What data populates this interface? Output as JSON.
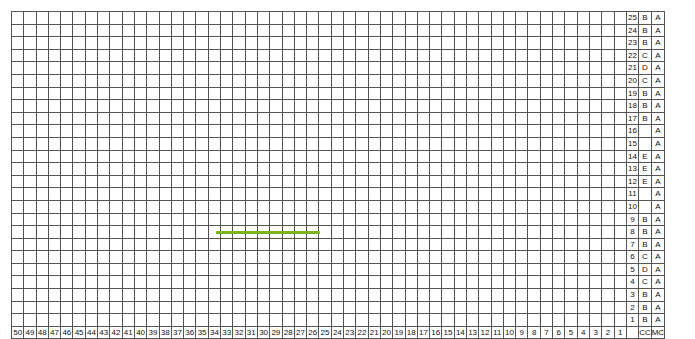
{
  "chart_meta": {
    "title": "Colorwork Knitting Chart",
    "columns": 50,
    "rows": 25,
    "column_direction": "right-to-left",
    "repeat_width": 12,
    "bottom_left_label": "",
    "legend_header_cc": "CC",
    "legend_header_mc": "MC"
  },
  "colors": {
    "A": "#ffffff",
    "B": "#d9576b",
    "C": "#d9a3b5",
    "D": "#f0931e",
    "E": "#9a4a12",
    "grid_line": "#555555",
    "marker": "#7ab51d",
    "background": "#ffffff",
    "text": "#111111"
  },
  "row_numbers": [
    25,
    24,
    23,
    22,
    21,
    20,
    19,
    18,
    17,
    16,
    15,
    14,
    13,
    12,
    11,
    10,
    9,
    8,
    7,
    6,
    5,
    4,
    3,
    2,
    1
  ],
  "column_numbers": [
    50,
    49,
    48,
    47,
    46,
    45,
    44,
    43,
    42,
    41,
    40,
    39,
    38,
    37,
    36,
    35,
    34,
    33,
    32,
    31,
    30,
    29,
    28,
    27,
    26,
    25,
    24,
    23,
    22,
    21,
    20,
    19,
    18,
    17,
    16,
    15,
    14,
    13,
    12,
    11,
    10,
    9,
    8,
    7,
    6,
    5,
    4,
    3,
    2,
    1
  ],
  "legend_cc": [
    "B",
    "B",
    "B",
    "C",
    "D",
    "C",
    "B",
    "B",
    "B",
    "",
    "",
    "E",
    "E",
    "E",
    "",
    "",
    "B",
    "B",
    "B",
    "C",
    "D",
    "C",
    "B",
    "B",
    "B"
  ],
  "legend_mc": [
    "A",
    "A",
    "A",
    "A",
    "A",
    "A",
    "A",
    "A",
    "A",
    "A",
    "A",
    "A",
    "A",
    "A",
    "A",
    "A",
    "A",
    "A",
    "A",
    "A",
    "A",
    "A",
    "A",
    "A",
    "A"
  ],
  "marker": {
    "name": "repeat-marker-line",
    "left_px": 216,
    "top_px": 231,
    "width_px": 104,
    "color": "#7ab51d",
    "spans_columns": "26-35"
  },
  "chart_data": {
    "type": "heatmap",
    "xlabel": "Stitch number",
    "ylabel": "Row number",
    "legend": [
      {
        "code": "A",
        "name": "MC white",
        "color": "#ffffff"
      },
      {
        "code": "B",
        "name": "dark pink",
        "color": "#d9576b"
      },
      {
        "code": "C",
        "name": "light pink",
        "color": "#d9a3b5"
      },
      {
        "code": "D",
        "name": "orange",
        "color": "#f0931e"
      },
      {
        "code": "E",
        "name": "brown",
        "color": "#9a4a12"
      }
    ],
    "grid": [
      "AAAAAABAAAAABAAAAABAAAAABAAAAABAAAAABAAAAABAAAAAB",
      "AAAAABBAAAABBAAAABBAAAABBAAAABBAAAABBAAAABBAAAABB",
      "BAABBAABBAABBAABBAABBAABBAABBAABBAABBAABBAABBAABB",
      "CAACCAACCAACCAACCAACCAACCAACCAACCAACCAACCAACCAACC",
      "AADAAAAADAAAAADAAAAADAAAAADAAAAADAAAAADAAAAADAAAA",
      "CAACCAACCAACCAACCAACCAACCAACCAACCAACCAACCAACCAACC",
      "BAABBAABBAABBAABBAABBAABBAABBAABBAABBAABBAABBAABB",
      "AAAAABBAAAABBAAAABBAAAABBAAAABBAAAABBAAAABBAAAABB",
      "AAAAAABAAAAABAAAAABAAAAABAAAAABAAAAABAAAAABAAAAAB",
      "AAAAAAAAAAAAAAAAAAAAAAAAAAAAAAAAAAAAAAAAAAAAAAAAA",
      "AAAAAAAAAAAAAAAAAAAAAAAAAAAAAAAAAAAAAAAAAAAAAAAAA",
      "AEEAAAAEEAAAAEEAAAAEEAAAAEEAAAAEEAAAAEEAAAAEEAAAA",
      "EAAEAAEAAEAAEAAEAAEAAEAAEAAEAAEAAEAAEAAEAAEAAEAAE",
      "EAAAEEAAAEEAAAEEAAAEEAAAEEAAAEEAAAEEAAAEEAAAEEAAA",
      "AAAAAAAAAAAAAAAAAAAAAAAAAAAAAAAAAAAAAAAAAAAAAAAAA",
      "AAAAAAAAAAAAAAAAAAAAAAAAAAAAAAAAAAAAAAAAAAAAAAAAA",
      "AAAAAABAAAAABAAAAABAAAAABAAAAABAAAAABAAAAABAAAAAB",
      "AAAAABBAAAABBAAAABBAAAABBAAAABBAAAABBAAAABBAAAABB",
      "BAABBAABBAABBAABBAABBAABBAABBAABBAABBAABBAABBAABB",
      "CAACCAACCAACCAACCAACCAACCAACCAACCAACCAACCAACCAACC",
      "AADAAAAADAAAAADAAAAADAAAAADAAAAADAAAAADAAAAADAAAA",
      "CAACCAACCAACCAACCAACCAACCAACCAACCAACCAACCAACCAACC",
      "BAABBAABBAABBAABBAABBAABBAABBAABBAABBAABBAABBAABB",
      "AAAAABBAAAABBAAAABBAAAABBAAAABBAAAABBAAAABBAAAABB",
      "AAAAAABAAAAABAAAAABAAAAABAAAAABAAAAABAAAAABAAAAAB"
    ]
  }
}
